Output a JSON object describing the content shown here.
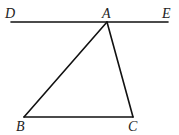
{
  "diagram": {
    "type": "geometry",
    "points": {
      "D": {
        "label": "D",
        "x": 11,
        "y": 22
      },
      "A": {
        "label": "A",
        "x": 107,
        "y": 22
      },
      "E": {
        "label": "E",
        "x": 168,
        "y": 22
      },
      "B": {
        "label": "B",
        "x": 24,
        "y": 117
      },
      "C": {
        "label": "C",
        "x": 133,
        "y": 117
      }
    },
    "segments": [
      [
        "D",
        "E"
      ],
      [
        "A",
        "B"
      ],
      [
        "A",
        "C"
      ],
      [
        "B",
        "C"
      ]
    ],
    "labels": {
      "D": "D",
      "A": "A",
      "E": "E",
      "B": "B",
      "C": "C"
    }
  }
}
